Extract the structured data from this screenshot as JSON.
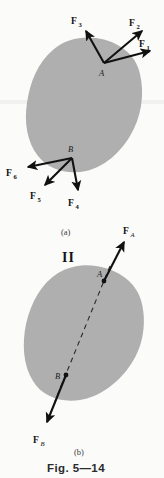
{
  "figure": {
    "caption": "Fig. 5—14",
    "background_color": "#fbfbfa",
    "body_color": "#afafaf",
    "ink_color": "#111111"
  },
  "panel_a": {
    "label": "(a)",
    "points": [
      {
        "name": "A",
        "label": "A",
        "x": 104,
        "y": 63
      },
      {
        "name": "B",
        "label": "B",
        "x": 72,
        "y": 158
      }
    ],
    "forces": [
      {
        "name": "F1",
        "base": "F",
        "subscript": "1",
        "label": "F1",
        "from_point": "A",
        "tip_x": 152,
        "tip_y": 50,
        "label_x": 141,
        "label_y": 44
      },
      {
        "name": "F2",
        "base": "F",
        "subscript": "2",
        "label": "F2",
        "from_point": "A",
        "tip_x": 143,
        "tip_y": 29,
        "label_x": 133,
        "label_y": 23
      },
      {
        "name": "F3",
        "base": "F",
        "subscript": "3",
        "label": "F3",
        "from_point": "A",
        "tip_x": 85,
        "tip_y": 29,
        "label_x": 75,
        "label_y": 22
      },
      {
        "name": "F4",
        "base": "F",
        "subscript": "4",
        "label": "F4",
        "from_point": "B",
        "tip_x": 78,
        "tip_y": 192,
        "label_x": 70,
        "label_y": 205
      },
      {
        "name": "F5",
        "base": "F",
        "subscript": "5",
        "label": "F5",
        "from_point": "B",
        "tip_x": 44,
        "tip_y": 186,
        "label_x": 31,
        "label_y": 199
      },
      {
        "name": "F6",
        "base": "F",
        "subscript": "6",
        "label": "F6",
        "from_point": "B",
        "tip_x": 26,
        "tip_y": 167,
        "label_x": 8,
        "label_y": 177
      }
    ]
  },
  "panel_b": {
    "label": "(b)",
    "roman_numeral": "II",
    "points": [
      {
        "name": "A",
        "label": "A",
        "x": 104,
        "y": 280
      },
      {
        "name": "B",
        "label": "B",
        "x": 62,
        "y": 385
      }
    ],
    "forces": [
      {
        "name": "FA",
        "base": "F",
        "subscript": "A",
        "label": "FA",
        "from_point": "A",
        "tip_x": 125,
        "tip_y": 240,
        "label_x": 126,
        "label_y": 231
      },
      {
        "name": "FB",
        "base": "F",
        "subscript": "B",
        "label": "FB",
        "from_point": "B",
        "tip_x": 45,
        "tip_y": 425,
        "label_x": 36,
        "label_y": 442
      }
    ],
    "line_of_action": {
      "name": "dashed-line-of-action",
      "x1": 110,
      "y1": 268,
      "x2": 56,
      "y2": 400
    }
  }
}
